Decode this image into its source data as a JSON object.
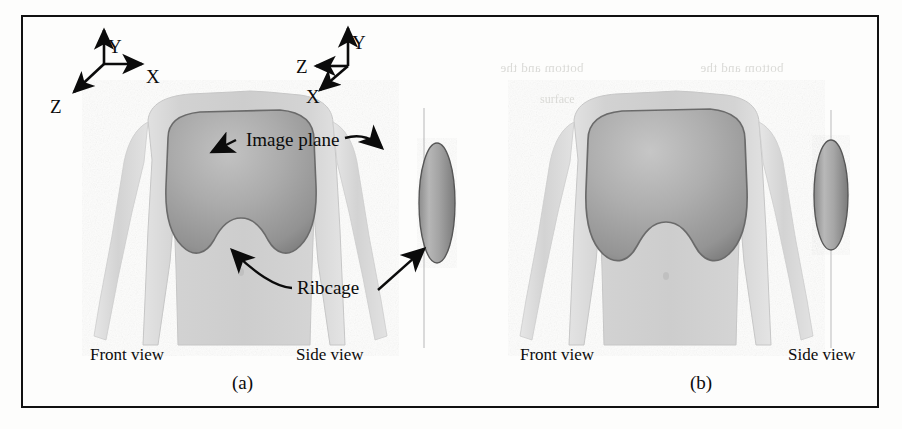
{
  "figure": {
    "kind": "scanned-paper-figure",
    "border_color": "#111111",
    "background": "#ffffff"
  },
  "palette": {
    "torso_fill": "#d6d6d6",
    "torso_edge": "#c2c2c2",
    "ribcage_fill": "#a9a9a9",
    "ribcage_edge": "#6f6f6f",
    "ellipsoid_fill": "#a2a2a2",
    "ellipsoid_edge": "#5d5d5d",
    "image_plane_line": "#b9b9b9",
    "ink": "#0b0b0b"
  },
  "axes": [
    {
      "id": "axes-left",
      "origin": {
        "x": 104,
        "y": 64
      },
      "labels": {
        "y": "Y",
        "x": "X",
        "z": "Z"
      },
      "directions": {
        "y": "up",
        "x": "right",
        "z": "down-left"
      }
    },
    {
      "id": "axes-right",
      "origin": {
        "x": 335,
        "y": 64
      },
      "labels": {
        "y": "Y",
        "x": "X",
        "z": "Z"
      },
      "directions": {
        "y": "up",
        "x": "down-left",
        "z": "left"
      }
    }
  ],
  "annotations": [
    {
      "id": "image-plane",
      "text": "Image plane"
    },
    {
      "id": "ribcage",
      "text": "Ribcage"
    }
  ],
  "panels": [
    {
      "id": "panel-a",
      "caption": "(a)",
      "views": [
        {
          "id": "a-front",
          "label": "Front view"
        },
        {
          "id": "a-side",
          "label": "Side view"
        }
      ]
    },
    {
      "id": "panel-b",
      "caption": "(b)",
      "views": [
        {
          "id": "b-front",
          "label": "Front view"
        },
        {
          "id": "b-side",
          "label": "Side view"
        }
      ]
    }
  ],
  "ghost_text": {
    "line1": "bottom and the",
    "line2": "surface"
  }
}
